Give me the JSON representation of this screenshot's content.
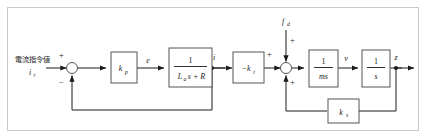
{
  "diagram": {
    "type": "control-block-diagram",
    "frame_color": "#c9c9c9",
    "line_color": "#1a1a1a",
    "block_stroke": "#555555",
    "background": "#ffffff",
    "input": {
      "label_jp": "電流指令値",
      "label_var": "i",
      "label_sub": "r"
    },
    "blocks": {
      "kp": {
        "base": "k",
        "sub": "p"
      },
      "plant": {
        "numerator": "1",
        "den_L": "L",
        "den_L_sub": "a",
        "den_rest": "s + R"
      },
      "torque": {
        "base": "−k",
        "sub": "t"
      },
      "mass": {
        "numerator": "1",
        "denominator": "ms"
      },
      "integrator": {
        "numerator": "1",
        "denominator": "s"
      },
      "spring": {
        "base": "k",
        "sub": "s"
      }
    },
    "signals": {
      "error": "e",
      "current": "i",
      "velocity": "v",
      "position": "z",
      "disturbance_base": "f",
      "disturbance_sub": "d"
    },
    "signs": {
      "sum1_plus": "+",
      "sum1_minus": "−",
      "sum2_left_plus": "+",
      "sum2_top_plus": "+",
      "sum2_bottom_plus": "+"
    }
  }
}
